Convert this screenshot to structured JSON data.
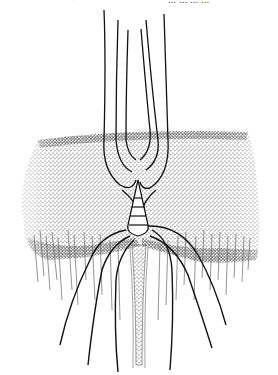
{
  "figure": {
    "kind": "scientific-illustration",
    "top_text_fragments": {
      "left": "·",
      "right": "... ... ... ..."
    },
    "colors": {
      "ink": "#111111",
      "stipple": "#3a3a3a",
      "background": "#ffffff"
    },
    "elements": {
      "upper_setae_count": 6,
      "lower_long_setae_count": 6,
      "segments_in_cone": 4
    }
  }
}
